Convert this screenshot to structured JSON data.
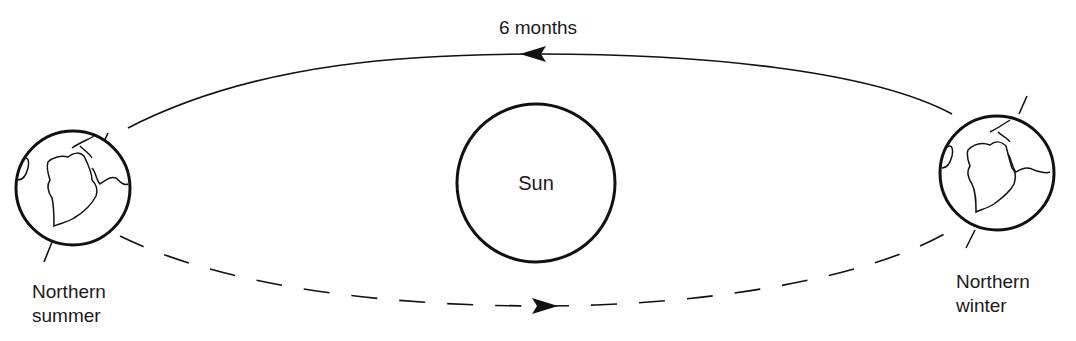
{
  "diagram": {
    "type": "orbit-diagram",
    "top_label": "6 months",
    "sun_label": "Sun",
    "left_earth": {
      "label_line1": "Northern",
      "label_line2": "summer"
    },
    "right_earth": {
      "label_line1": "Northern",
      "label_line2": "winter"
    },
    "top_path_style": "solid",
    "top_arrow_direction": "left",
    "bottom_path_style": "dashed",
    "bottom_arrow_direction": "right",
    "colors": {
      "stroke": "#111111",
      "background": "#ffffff",
      "text": "#1a1a1a"
    }
  }
}
